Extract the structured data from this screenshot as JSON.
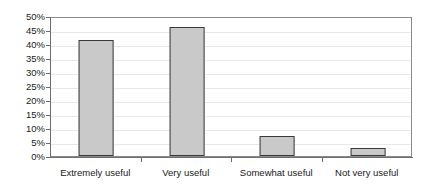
{
  "chart_data": {
    "type": "bar",
    "title": "",
    "subtitle": "",
    "xlabel": "",
    "ylabel": "",
    "categories": [
      "Extremely useful",
      "Very useful",
      "Somewhat useful",
      "Not very useful"
    ],
    "values": [
      41.5,
      46.0,
      7.0,
      2.7
    ],
    "value_format": "percent",
    "ylim": [
      0,
      50
    ],
    "ytick_step": 5,
    "ytick_labels": [
      "50%",
      "45%",
      "40%",
      "35%",
      "30%",
      "25%",
      "20%",
      "15%",
      "10%",
      "5%",
      "0%"
    ],
    "ytick_values": [
      50,
      45,
      40,
      35,
      30,
      25,
      20,
      15,
      10,
      5,
      0
    ],
    "grid": true,
    "grid_axis": "y",
    "legend": false,
    "legend_position": "none",
    "series": [
      {
        "name": "",
        "values": [
          41.5,
          46.0,
          7.0,
          2.7
        ]
      }
    ],
    "colors": {
      "bar_fill": "#c9c9c9",
      "bar_border": "#3a3a3a",
      "gridline": "#e9e9e9",
      "axis": "#6e6e6e",
      "plot_border": "#8a8a8a",
      "text": "#1a1a1a",
      "background": "#ffffff"
    }
  }
}
